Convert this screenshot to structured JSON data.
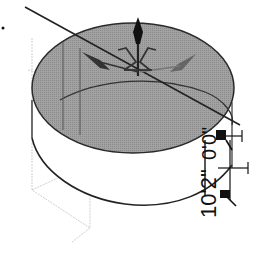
{
  "viewport": {
    "type": "3d-model-viewport",
    "background": "#ffffff",
    "object": {
      "kind": "cylinder",
      "top_face_color": "#9a9a9a",
      "edge_color": "#1a1a1a"
    },
    "gizmo": {
      "kind": "move-rotate-gizmo",
      "color": "#333333"
    },
    "dimension": {
      "height_label": "10'2\"",
      "offset_label": "0'0\""
    },
    "colors": {
      "wireframe": "#c8c8c8",
      "axis_line": "#222222"
    }
  }
}
